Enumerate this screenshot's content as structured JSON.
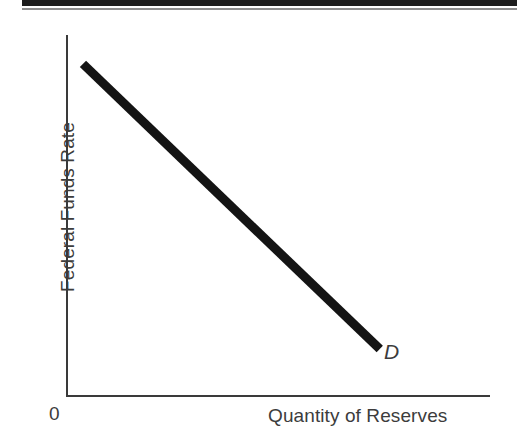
{
  "figure": {
    "background_color": "#ffffff",
    "rule_color": "#1d1d1d",
    "rule_thin_color": "#8e8e8e",
    "axis_color": "#3a3a3a",
    "text_color": "#3c3c3c"
  },
  "axes": {
    "y_title": "Federal Funds Rate",
    "x_title": "Quantity of Reserves",
    "origin_label": "0"
  },
  "curve": {
    "label": "D",
    "color": "#141414",
    "width_px": 9
  },
  "chart_data": {
    "type": "line",
    "title": "",
    "subtitle": "",
    "xlabel": "Quantity of Reserves",
    "ylabel": "Federal Funds Rate",
    "xlim": [
      0,
      100
    ],
    "ylim": [
      0,
      100
    ],
    "grid": false,
    "legend": "none",
    "axis_tick_labels": {
      "x": [],
      "y": []
    },
    "annotations": [
      {
        "text": "D",
        "x": 75,
        "y": 11,
        "style": "italic",
        "meaning": "demand-curve-label"
      },
      {
        "text": "0",
        "x": 0,
        "y": 0,
        "style": "normal",
        "meaning": "origin-label"
      }
    ],
    "series": [
      {
        "name": "D",
        "label": "Demand for reserves",
        "color": "#141414",
        "linewidth": 9,
        "x": [
          4,
          74
        ],
        "y": [
          92,
          13
        ],
        "points": [
          {
            "x": 4,
            "y": 92
          },
          {
            "x": 74,
            "y": 13
          }
        ]
      }
    ]
  }
}
